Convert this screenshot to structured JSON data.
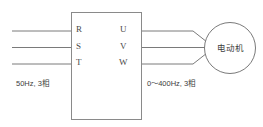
{
  "diagram": {
    "inverter": {
      "input_terminals": [
        {
          "label": "R"
        },
        {
          "label": "S"
        },
        {
          "label": "T"
        }
      ],
      "output_terminals": [
        {
          "label": "U"
        },
        {
          "label": "V"
        },
        {
          "label": "W"
        }
      ]
    },
    "motor": {
      "label": "电动机"
    },
    "annotations": {
      "input_supply": "50Hz, 3相",
      "output_supply": "0～400Hz, 3相"
    },
    "colors": {
      "line": "#7a7a7a",
      "box_border": "#8a8a8a",
      "text": "#3d3d3d",
      "terminal_text": "#4a4a4a",
      "background": "#ffffff"
    }
  }
}
